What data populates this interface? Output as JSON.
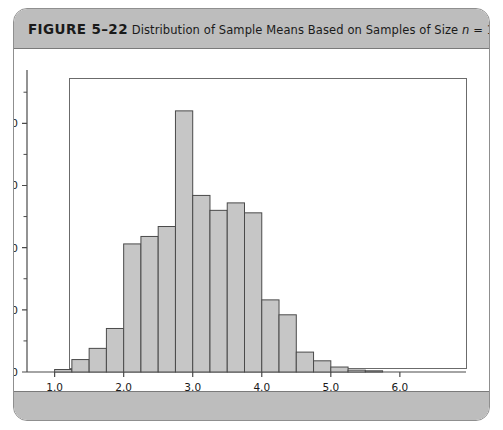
{
  "figure": {
    "number_label": "FIGURE 5–22",
    "caption_part1": "Distribution of Sample Means Based on Samples of Size ",
    "caption_italic": "n",
    "caption_part2": " = 10"
  },
  "chart_data": {
    "type": "bar",
    "title": "Distribution of Sample Means Based on Samples of Size n = 10",
    "xlabel": "",
    "ylabel": "",
    "grid": false,
    "legend": "none",
    "bin_width": 0.25,
    "xlim": [
      0.6,
      6.9
    ],
    "ylim": [
      0,
      23000
    ],
    "xtick_labels": [
      "1.0",
      "2.0",
      "3.0",
      "4.0",
      "5.0",
      "6.0"
    ],
    "xticks": [
      1.0,
      2.0,
      3.0,
      4.0,
      5.0,
      6.0
    ],
    "ytick_labels": [
      "0",
      "5000",
      "10000",
      "15000",
      "20000"
    ],
    "yticks": [
      0,
      5000,
      10000,
      15000,
      20000
    ],
    "yticks_minor": [
      2500,
      7500,
      12500,
      17500,
      22500
    ],
    "bar_fill": "#c6c6c6",
    "bar_edge": "#4a4a4a",
    "bins": [
      {
        "x0": 1.0,
        "x1": 1.25,
        "value": 200
      },
      {
        "x0": 1.25,
        "x1": 1.5,
        "value": 1000
      },
      {
        "x0": 1.5,
        "x1": 1.75,
        "value": 1900
      },
      {
        "x0": 1.75,
        "x1": 2.0,
        "value": 3500
      },
      {
        "x0": 2.0,
        "x1": 2.25,
        "value": 10300
      },
      {
        "x0": 2.25,
        "x1": 2.5,
        "value": 10900
      },
      {
        "x0": 2.5,
        "x1": 2.75,
        "value": 11700
      },
      {
        "x0": 2.75,
        "x1": 3.0,
        "value": 21000
      },
      {
        "x0": 3.0,
        "x1": 3.25,
        "value": 14200
      },
      {
        "x0": 3.25,
        "x1": 3.5,
        "value": 13000
      },
      {
        "x0": 3.5,
        "x1": 3.75,
        "value": 13600
      },
      {
        "x0": 3.75,
        "x1": 4.0,
        "value": 12800
      },
      {
        "x0": 4.0,
        "x1": 4.25,
        "value": 5800
      },
      {
        "x0": 4.25,
        "x1": 4.5,
        "value": 4600
      },
      {
        "x0": 4.5,
        "x1": 4.75,
        "value": 1600
      },
      {
        "x0": 4.75,
        "x1": 5.0,
        "value": 900
      },
      {
        "x0": 5.0,
        "x1": 5.25,
        "value": 400
      },
      {
        "x0": 5.25,
        "x1": 5.5,
        "value": 150
      },
      {
        "x0": 5.5,
        "x1": 5.75,
        "value": 60
      }
    ]
  }
}
